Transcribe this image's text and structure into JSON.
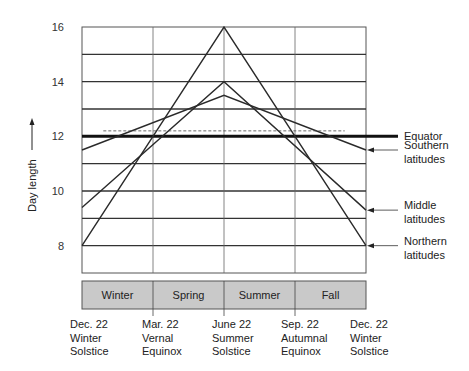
{
  "chart_data": {
    "type": "line",
    "title": "",
    "xlabel": "",
    "ylabel": "Day length",
    "ylim": [
      7,
      16
    ],
    "yticks": [
      8,
      10,
      12,
      14,
      16
    ],
    "grid": true,
    "x": [
      "Dec. 22",
      "Mar. 22",
      "June 22",
      "Sep. 22",
      "Dec. 22"
    ],
    "x_annotations": [
      {
        "date": "Dec. 22",
        "line2": "Winter",
        "line3": "Solstice"
      },
      {
        "date": "Mar. 22",
        "line2": "Vernal",
        "line3": "Equinox"
      },
      {
        "date": "June 22",
        "line2": "Summer",
        "line3": "Solstice"
      },
      {
        "date": "Sep. 22",
        "line2": "Autumnal",
        "line3": "Equinox"
      },
      {
        "date": "Dec. 22",
        "line2": "Winter",
        "line3": "Solstice"
      }
    ],
    "seasons": [
      "Winter",
      "Spring",
      "Summer",
      "Fall"
    ],
    "series": [
      {
        "name": "Equator",
        "values": [
          12,
          12,
          12,
          12,
          12
        ],
        "style": "thick"
      },
      {
        "name": "Southern latitudes",
        "values": [
          11.5,
          null,
          13.5,
          null,
          11.5
        ],
        "points": [
          [
            0,
            11.5
          ],
          [
            2,
            13.5
          ],
          [
            4,
            11.5
          ]
        ]
      },
      {
        "name": "Middle latitudes",
        "values": [
          9.4,
          null,
          14,
          null,
          9.3
        ],
        "points": [
          [
            0,
            9.4
          ],
          [
            2,
            14
          ],
          [
            4,
            9.3
          ]
        ]
      },
      {
        "name": "Northern latitudes",
        "values": [
          8,
          null,
          16,
          null,
          8
        ],
        "points": [
          [
            0,
            8
          ],
          [
            2,
            16
          ],
          [
            4,
            8
          ]
        ]
      },
      {
        "name": "Dashed reference",
        "style": "dashed",
        "points": [
          [
            0.3,
            12.2
          ],
          [
            3.7,
            12.2
          ]
        ]
      }
    ],
    "legend": [
      {
        "label": "Equator"
      },
      {
        "label": "Southern latitudes",
        "line1": "Southern",
        "line2": "latitudes"
      },
      {
        "label": "Middle latitudes",
        "line1": "Middle",
        "line2": "latitudes"
      },
      {
        "label": "Northern latitudes",
        "line1": "Northern",
        "line2": "latitudes"
      }
    ]
  },
  "colors": {
    "line": "#2a2a2a",
    "grid": "#333333",
    "season_fill": "#c9c9c9",
    "season_border": "#555555"
  }
}
